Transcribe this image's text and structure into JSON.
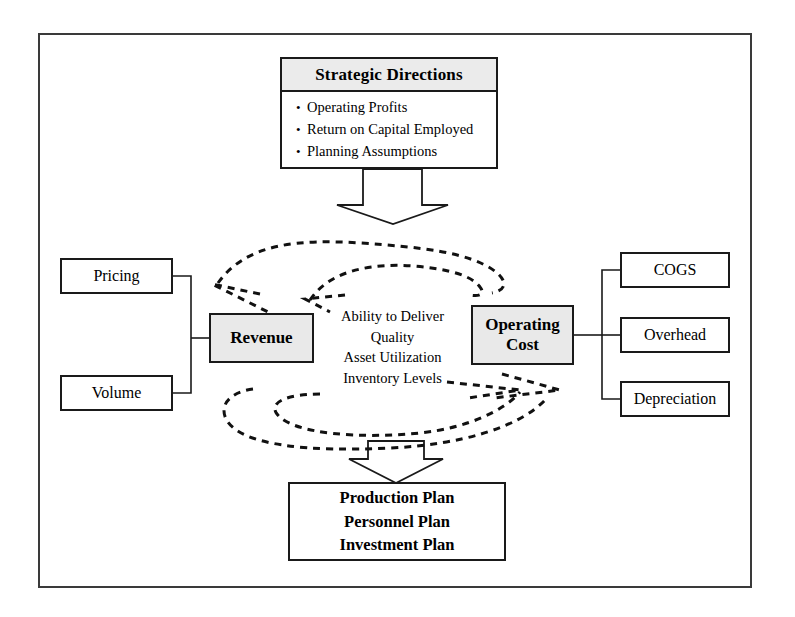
{
  "diagram": {
    "colors": {
      "frame_border": "#3a3a3a",
      "node_border": "#1a1a1a",
      "shaded_fill": "#e9e9e9",
      "header_fill": "#ebebeb",
      "background": "#ffffff",
      "line": "#000000"
    },
    "strategic_directions": {
      "header": "Strategic Directions",
      "bullet_glyph": "•",
      "bullets": [
        "Operating Profits",
        "Return on Capital Employed",
        "Planning Assumptions"
      ]
    },
    "revenue_drivers": [
      {
        "label": "Pricing"
      },
      {
        "label": "Volume"
      }
    ],
    "cost_drivers": [
      {
        "label": "COGS"
      },
      {
        "label": "Overhead"
      },
      {
        "label": "Depreciation"
      }
    ],
    "revenue": {
      "label": "Revenue"
    },
    "operating_cost": {
      "line1": "Operating",
      "line2": "Cost"
    },
    "center_factors": [
      "Ability to Deliver",
      "Quality",
      "Asset Utilization",
      "Inventory Levels"
    ],
    "plans": [
      "Production Plan",
      "Personnel Plan",
      "Investment Plan"
    ],
    "connectors": {
      "top_block_arrow": "down-block-arrow-from-strategic-directions",
      "bottom_block_arrow": "down-block-arrow-to-plans",
      "top_dashed_arcs": "revenue-to-operating-cost-feedback",
      "bottom_dashed_arcs": "operating-cost-to-revenue-feedback",
      "left_bracket": "pricing-volume-to-revenue",
      "right_bracket": "cogs-overhead-depreciation-to-operating-cost"
    }
  }
}
